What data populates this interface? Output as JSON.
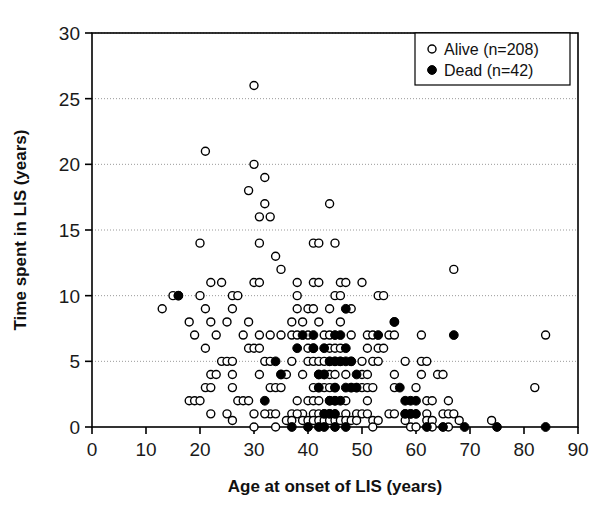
{
  "chart_data": {
    "type": "scatter",
    "title": "",
    "xlabel": "Age at onset of LIS (years)",
    "ylabel": "Time spent in LIS (years)",
    "xlim": [
      0,
      90
    ],
    "ylim": [
      0,
      30
    ],
    "xticks": [
      0,
      10,
      20,
      30,
      40,
      50,
      60,
      70,
      80,
      90
    ],
    "yticks": [
      0,
      5,
      10,
      15,
      20,
      25,
      30
    ],
    "grid": "horizontal-dotted",
    "legend_position": "top-right",
    "series": [
      {
        "name": "Alive (n=208)",
        "marker": "open-circle",
        "color": "#000000",
        "fill": "#ffffff",
        "n": 208,
        "points": [
          [
            30,
            26
          ],
          [
            21,
            21
          ],
          [
            30,
            20
          ],
          [
            32,
            19
          ],
          [
            29,
            18
          ],
          [
            32,
            17
          ],
          [
            44,
            17
          ],
          [
            31,
            16
          ],
          [
            33,
            16
          ],
          [
            20,
            14
          ],
          [
            31,
            14
          ],
          [
            41,
            14
          ],
          [
            42,
            14
          ],
          [
            45,
            14
          ],
          [
            34,
            13
          ],
          [
            35,
            12
          ],
          [
            67,
            12
          ],
          [
            22,
            11
          ],
          [
            24,
            11
          ],
          [
            30,
            11
          ],
          [
            31,
            11
          ],
          [
            38,
            11
          ],
          [
            41,
            11
          ],
          [
            42,
            11
          ],
          [
            46,
            11
          ],
          [
            47,
            11
          ],
          [
            50,
            11
          ],
          [
            15,
            10
          ],
          [
            16,
            10
          ],
          [
            20,
            10
          ],
          [
            26,
            10
          ],
          [
            27,
            10
          ],
          [
            38,
            10
          ],
          [
            45,
            10
          ],
          [
            46,
            10
          ],
          [
            53,
            10
          ],
          [
            54,
            10
          ],
          [
            13,
            9
          ],
          [
            21,
            9
          ],
          [
            26,
            9
          ],
          [
            38,
            9
          ],
          [
            40,
            9
          ],
          [
            41,
            9
          ],
          [
            44,
            9
          ],
          [
            48,
            9
          ],
          [
            18,
            8
          ],
          [
            22,
            8
          ],
          [
            25,
            8
          ],
          [
            29,
            8
          ],
          [
            37,
            8
          ],
          [
            39,
            8
          ],
          [
            42,
            8
          ],
          [
            46,
            8
          ],
          [
            56,
            8
          ],
          [
            19,
            7
          ],
          [
            23,
            7
          ],
          [
            28,
            7
          ],
          [
            31,
            7
          ],
          [
            33,
            7
          ],
          [
            35,
            7
          ],
          [
            37,
            7
          ],
          [
            38,
            7
          ],
          [
            40,
            7
          ],
          [
            43,
            7
          ],
          [
            44,
            7
          ],
          [
            48,
            7
          ],
          [
            51,
            7
          ],
          [
            52,
            7
          ],
          [
            55,
            7
          ],
          [
            56,
            7
          ],
          [
            61,
            7
          ],
          [
            84,
            7
          ],
          [
            21,
            6
          ],
          [
            29,
            6
          ],
          [
            30,
            6
          ],
          [
            31,
            6
          ],
          [
            40,
            6
          ],
          [
            41,
            6
          ],
          [
            44,
            6
          ],
          [
            45,
            6
          ],
          [
            46,
            6
          ],
          [
            51,
            6
          ],
          [
            53,
            6
          ],
          [
            54,
            6
          ],
          [
            24,
            5
          ],
          [
            25,
            5
          ],
          [
            26,
            5
          ],
          [
            32,
            5
          ],
          [
            33,
            5
          ],
          [
            37,
            5
          ],
          [
            40,
            5
          ],
          [
            41,
            5
          ],
          [
            42,
            5
          ],
          [
            43,
            5
          ],
          [
            44,
            5
          ],
          [
            45,
            5
          ],
          [
            46,
            5
          ],
          [
            48,
            5
          ],
          [
            50,
            5
          ],
          [
            52,
            5
          ],
          [
            53,
            5
          ],
          [
            58,
            5
          ],
          [
            61,
            5
          ],
          [
            62,
            5
          ],
          [
            22,
            4
          ],
          [
            23,
            4
          ],
          [
            26,
            4
          ],
          [
            31,
            4
          ],
          [
            35,
            4
          ],
          [
            36,
            4
          ],
          [
            39,
            4
          ],
          [
            42,
            4
          ],
          [
            43,
            4
          ],
          [
            44,
            4
          ],
          [
            45,
            4
          ],
          [
            47,
            4
          ],
          [
            50,
            4
          ],
          [
            51,
            4
          ],
          [
            56,
            4
          ],
          [
            61,
            4
          ],
          [
            64,
            4
          ],
          [
            65,
            4
          ],
          [
            21,
            3
          ],
          [
            22,
            3
          ],
          [
            26,
            3
          ],
          [
            33,
            3
          ],
          [
            34,
            3
          ],
          [
            35,
            3
          ],
          [
            41,
            3
          ],
          [
            42,
            3
          ],
          [
            43,
            3
          ],
          [
            44,
            3
          ],
          [
            45,
            3
          ],
          [
            48,
            3
          ],
          [
            49,
            3
          ],
          [
            50,
            3
          ],
          [
            51,
            3
          ],
          [
            52,
            3
          ],
          [
            56,
            3
          ],
          [
            60,
            3
          ],
          [
            82,
            3
          ],
          [
            18,
            2
          ],
          [
            19,
            2
          ],
          [
            20,
            2
          ],
          [
            27,
            2
          ],
          [
            28,
            2
          ],
          [
            29,
            2
          ],
          [
            38,
            2
          ],
          [
            40,
            2
          ],
          [
            41,
            2
          ],
          [
            42,
            2
          ],
          [
            44,
            2
          ],
          [
            45,
            2
          ],
          [
            47,
            2
          ],
          [
            51,
            2
          ],
          [
            62,
            2
          ],
          [
            63,
            2
          ],
          [
            66,
            2
          ],
          [
            22,
            1
          ],
          [
            30,
            1
          ],
          [
            33,
            1
          ],
          [
            34,
            1
          ],
          [
            39,
            1
          ],
          [
            41,
            1
          ],
          [
            42,
            1
          ],
          [
            44,
            1
          ],
          [
            47,
            1
          ],
          [
            55,
            1
          ],
          [
            56,
            1
          ],
          [
            62,
            1
          ],
          [
            65,
            1
          ],
          [
            25,
            1
          ],
          [
            32,
            1
          ],
          [
            37,
            1
          ],
          [
            38,
            1
          ],
          [
            43,
            1
          ],
          [
            49,
            1
          ],
          [
            50,
            1
          ],
          [
            51,
            1
          ],
          [
            58,
            1
          ],
          [
            59,
            1
          ],
          [
            66,
            1
          ],
          [
            67,
            1
          ],
          [
            26,
            0.5
          ],
          [
            36,
            0.5
          ],
          [
            37,
            0.5
          ],
          [
            39,
            0.5
          ],
          [
            40,
            0.5
          ],
          [
            41,
            0.5
          ],
          [
            42,
            0.5
          ],
          [
            43,
            0.5
          ],
          [
            44,
            0.5
          ],
          [
            45,
            0.5
          ],
          [
            46,
            0.5
          ],
          [
            47,
            0.5
          ],
          [
            48,
            0.5
          ],
          [
            49,
            0.5
          ],
          [
            52,
            0.5
          ],
          [
            53,
            0.5
          ],
          [
            58,
            0.5
          ],
          [
            62,
            0.5
          ],
          [
            63,
            0.5
          ],
          [
            68,
            0.5
          ],
          [
            74,
            0.5
          ],
          [
            30,
            0
          ],
          [
            34,
            0
          ],
          [
            52,
            0
          ],
          [
            59,
            0
          ],
          [
            60,
            0
          ],
          [
            63,
            0
          ],
          [
            66,
            0
          ]
        ]
      },
      {
        "name": "Dead (n=42)",
        "marker": "filled-circle",
        "color": "#000000",
        "fill": "#000000",
        "n": 42,
        "points": [
          [
            16,
            10
          ],
          [
            47,
            9
          ],
          [
            56,
            8
          ],
          [
            39,
            7
          ],
          [
            41,
            7
          ],
          [
            45,
            7
          ],
          [
            46,
            7
          ],
          [
            53,
            7
          ],
          [
            67,
            7
          ],
          [
            38,
            6
          ],
          [
            41,
            6
          ],
          [
            43,
            6
          ],
          [
            47,
            6
          ],
          [
            34,
            5
          ],
          [
            44,
            5
          ],
          [
            45,
            5
          ],
          [
            46,
            5
          ],
          [
            47,
            5
          ],
          [
            48,
            5
          ],
          [
            35,
            4
          ],
          [
            42,
            4
          ],
          [
            43,
            4
          ],
          [
            49,
            4
          ],
          [
            42,
            3
          ],
          [
            45,
            3
          ],
          [
            47,
            3
          ],
          [
            48,
            3
          ],
          [
            49,
            3
          ],
          [
            57,
            3
          ],
          [
            32,
            2
          ],
          [
            44,
            2
          ],
          [
            45,
            2
          ],
          [
            46,
            2
          ],
          [
            58,
            2
          ],
          [
            59,
            2
          ],
          [
            60,
            2
          ],
          [
            43,
            1
          ],
          [
            44,
            1
          ],
          [
            45,
            1
          ],
          [
            58,
            1
          ],
          [
            59,
            1
          ],
          [
            60,
            1
          ],
          [
            37,
            0
          ],
          [
            40,
            0
          ],
          [
            42,
            0
          ],
          [
            43,
            0
          ],
          [
            45,
            0
          ],
          [
            47,
            0
          ],
          [
            62,
            0
          ],
          [
            65,
            0
          ],
          [
            69,
            0
          ],
          [
            75,
            0
          ],
          [
            84,
            0
          ]
        ]
      }
    ]
  },
  "legend": {
    "items": [
      {
        "label": "Alive (n=208)",
        "marker": "open-circle"
      },
      {
        "label": "Dead (n=42)",
        "marker": "filled-circle"
      }
    ]
  },
  "axes": {
    "x_title": "Age at onset of LIS (years)",
    "y_title": "Time spent in LIS (years)",
    "x_tick_labels": [
      "0",
      "10",
      "20",
      "30",
      "40",
      "50",
      "60",
      "70",
      "80",
      "90"
    ],
    "y_tick_labels": [
      "0",
      "5",
      "10",
      "15",
      "20",
      "25",
      "30"
    ]
  },
  "style": {
    "axis_color": "#000000",
    "grid_color": "#9a9a9a",
    "marker_color": "#000000",
    "background": "#ffffff"
  }
}
